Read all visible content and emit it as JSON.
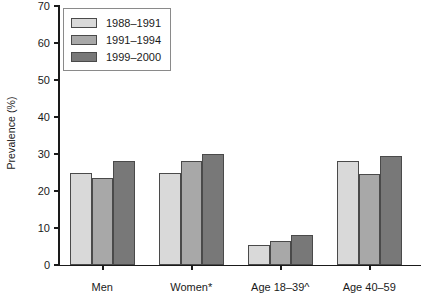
{
  "chart_data": {
    "type": "bar",
    "title": "",
    "xlabel": "",
    "ylabel": "Prevalence (%)",
    "ylim": [
      0,
      70
    ],
    "yticks": [
      0,
      10,
      20,
      30,
      40,
      50,
      60,
      70
    ],
    "grid": false,
    "legend_position": "top-left",
    "categories": [
      "Men",
      "Women*",
      "Age 18–39^",
      "Age 40–59",
      "Age≥60**"
    ],
    "series": [
      {
        "name": "1988–1991",
        "color": "#d9d9d9",
        "values": [
          25,
          25,
          5.5,
          28,
          57
        ]
      },
      {
        "name": "1991–1994",
        "color": "#a8a8a8",
        "values": [
          23.5,
          28,
          6.5,
          24.5,
          59.5
        ]
      },
      {
        "name": "1999–2000",
        "color": "#787878",
        "values": [
          28,
          30,
          8,
          29.5,
          65
        ]
      }
    ]
  },
  "axis": {
    "y_title": "Prevalence (%)"
  }
}
